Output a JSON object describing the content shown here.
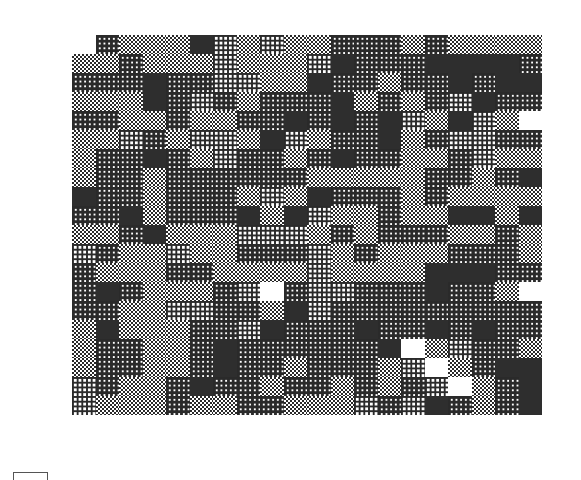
{
  "board": {
    "columns": 20,
    "rows": 20,
    "legend": {
      "W": "white",
      "L": "light-grid",
      "C": "checker",
      "G": "dense-grid",
      "D": "dark-solid",
      "_": "empty"
    },
    "colors": {
      "ink": "#2a2a2a",
      "dark": "#2e2e2e",
      "paper": "#ffffff"
    },
    "grid": [
      "_GCCCDLCLCCGGGCGCCCC",
      "CCGCCCLCCCLDGGGDDDDG",
      "GGGDGGLLCCDGGCGGDGDD",
      "CCCDGLGCGGGDCGCGLDGG",
      "GGCCGCCGGDGDGDLCDLC",
      "CCLGCLLCDLCGGDCGLLGG",
      "CGGDGCLGGCGDGGCCGLCC",
      "CGGCGGGGGGCCCCCGGCGD",
      "DGGCGGGCLCDGGGCGCCCC",
      "GGDCGGGDCDLCCGCCDDCD",
      "CCGDCCCLLLCGCGGGCCGC",
      "LGCCLCCGGGLCGCCCGGGC",
      "GCCCGGCCCCLCCCCDDDGG",
      "GDGCCCGLWGLLGGGDGGC",
      "GGCCLLGGCDLGGGGGGGGG",
      "CDCCCGGLDGGGDGGDGDGG",
      "CGGCCGDGGGGGGDWCLGGC",
      "CGGCCGDGGCGGGCLWCGDD",
      "LGCCGDGGCGGCGCGLWCGD",
      "LCCCGCCGGCCCLGLDGCGD"
    ]
  },
  "footer": {
    "indicator": "bracket"
  }
}
